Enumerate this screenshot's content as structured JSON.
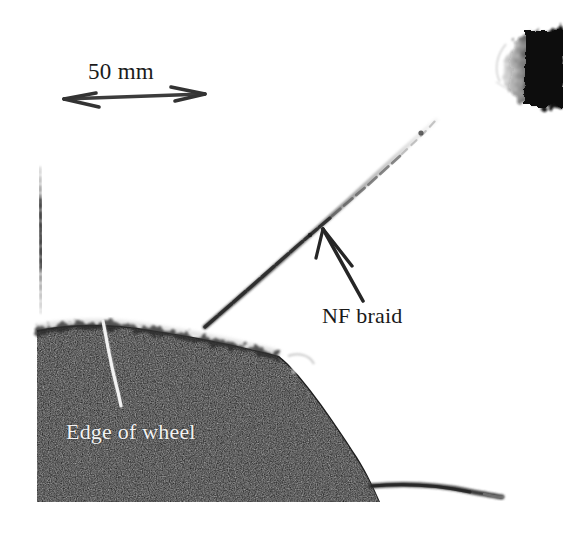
{
  "figure": {
    "type": "grayscale-photograph",
    "width": 563,
    "height": 535,
    "background_color": "#ffffff"
  },
  "annotations": {
    "scale_bar": {
      "label": "50 mm",
      "text_color": "#1b1b1b",
      "arrow_color": "#3a3a3a",
      "arrow_start_x": 62,
      "arrow_start_y": 100,
      "arrow_end_x": 206,
      "arrow_end_y": 94,
      "style": "double-headed-arrow"
    },
    "braid_callout": {
      "label": "NF braid",
      "text_color": "#191919",
      "arrow_color": "#2b2b2b",
      "arrow_tail_x": 362,
      "arrow_tail_y": 300,
      "arrow_tip_x": 322,
      "arrow_tip_y": 228
    },
    "wheel_callout": {
      "label": "Edge of wheel",
      "text_color": "#f2f2f2",
      "leader_color": "#f0f0f0",
      "leader_start_x": 103,
      "leader_start_y": 321,
      "leader_end_x": 121,
      "leader_end_y": 406
    }
  },
  "scene": {
    "wheel_region": {
      "name": "wheel",
      "fill_color": "#1b1b1b",
      "texture": "grainy",
      "top_left_x": 37,
      "bottom_y": 502,
      "right_x": 380
    },
    "braid_strand": {
      "name": "nf-braid",
      "color": "#4a4a4a",
      "start_x": 205,
      "start_y": 327,
      "end_x": 436,
      "end_y": 119,
      "appearance": "fades toward upper right"
    },
    "dotted_vertical_marker": {
      "name": "vertical-dotted-marker",
      "color": "#555555",
      "x": 40,
      "top_y": 168,
      "bottom_y": 312
    },
    "corner_blob": {
      "name": "dark-corner-blob",
      "color": "#141414",
      "left_x": 500,
      "top_y": 28,
      "right_x": 563,
      "bottom_y": 108
    },
    "trailing_strand": {
      "name": "lower-trailing-strand",
      "color": "#3c3c3c",
      "start_x": 372,
      "start_y": 487,
      "end_x": 502,
      "end_y": 497
    }
  }
}
